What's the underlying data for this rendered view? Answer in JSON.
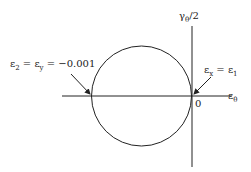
{
  "diagram": {
    "axes": {
      "horizontal_label": "ε",
      "horizontal_sub": "θ",
      "vertical_label": "γ",
      "vertical_sub": "θ",
      "vertical_suffix": "/2",
      "origin_label": "0"
    },
    "annotations": {
      "left": {
        "e2": "ε",
        "e2_sub": "2",
        "eq1": " = ε",
        "ey_sub": "y",
        "value": " = −0.001"
      },
      "right": {
        "ex": "ε",
        "ex_sub": "x",
        "eq": " = ε",
        "e1_sub": "1"
      }
    },
    "colors": {
      "stroke": "#222222",
      "background": "#ffffff"
    }
  }
}
